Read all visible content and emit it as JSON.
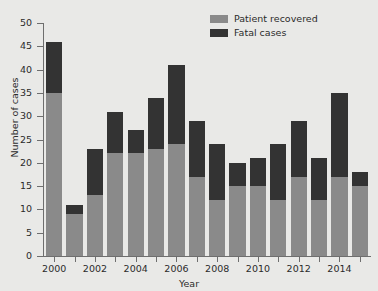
{
  "chart_data": {
    "type": "bar",
    "subtype": "stacked",
    "title": "",
    "xlabel": "Year",
    "ylabel": "Number of cases",
    "ylim": [
      0,
      50
    ],
    "ytick_step": 5,
    "yticks": [
      0,
      5,
      10,
      15,
      20,
      25,
      30,
      35,
      40,
      45,
      50
    ],
    "xticks_labeled": [
      "2000",
      "2002",
      "2004",
      "2006",
      "2008",
      "2010",
      "2012",
      "2014"
    ],
    "grid": false,
    "legend_position": "top-right",
    "categories": [
      "2000",
      "2001",
      "2002",
      "2003",
      "2004",
      "2005",
      "2006",
      "2007",
      "2008",
      "2009",
      "2010",
      "2011",
      "2012",
      "2013",
      "2014",
      "2015"
    ],
    "series": [
      {
        "name": "Patient recovered",
        "color": "#8a8a8a",
        "values": [
          35,
          9,
          13,
          22,
          22,
          23,
          24,
          17,
          12,
          15,
          15,
          12,
          17,
          12,
          17,
          15
        ]
      },
      {
        "name": "Fatal cases",
        "color": "#333333",
        "values": [
          11,
          2,
          10,
          9,
          5,
          11,
          17,
          12,
          12,
          5,
          6,
          12,
          12,
          9,
          18,
          3
        ]
      }
    ],
    "totals": [
      46,
      11,
      23,
      31,
      27,
      34,
      41,
      29,
      24,
      20,
      21,
      24,
      29,
      21,
      35,
      18
    ]
  },
  "legend": {
    "items": [
      {
        "label": "Patient recovered",
        "color": "#8a8a8a"
      },
      {
        "label": "Fatal cases",
        "color": "#333333"
      }
    ]
  },
  "axes": {
    "y_title": "Number of cases",
    "x_title": "Year"
  },
  "theme": {
    "background": "#e9e9e7",
    "axis_color": "#6e6e6e",
    "text_color": "#2b2b2b",
    "recovered_color": "#8a8a8a",
    "fatal_color": "#333333"
  }
}
